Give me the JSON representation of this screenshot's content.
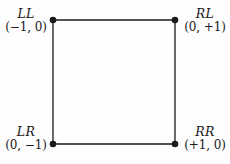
{
  "diagram": {
    "type": "square-graph",
    "background_color": "#fdfdfd",
    "stroke_color": "#1a1a1a",
    "vertices": [
      {
        "id": "top-left",
        "code": "LL",
        "coord": "(−1, 0)",
        "x": 53,
        "y": 20
      },
      {
        "id": "top-right",
        "code": "RL",
        "coord": "(0, +1)",
        "x": 175,
        "y": 20
      },
      {
        "id": "bottom-left",
        "code": "LR",
        "coord": "(0, −1)",
        "x": 53,
        "y": 144
      },
      {
        "id": "bottom-right",
        "code": "RR",
        "coord": "(+1, 0)",
        "x": 175,
        "y": 144
      }
    ],
    "edges": [
      {
        "id": "top-edge",
        "from": "top-left",
        "to": "top-right"
      },
      {
        "id": "right-edge",
        "from": "top-right",
        "to": "bottom-right"
      },
      {
        "id": "bottom-edge",
        "from": "bottom-left",
        "to": "bottom-right"
      },
      {
        "id": "left-edge",
        "from": "top-left",
        "to": "bottom-left"
      }
    ]
  }
}
